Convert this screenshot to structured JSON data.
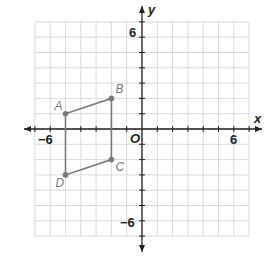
{
  "chart_data": {
    "type": "scatter",
    "title": "",
    "xlabel": "x",
    "ylabel": "y",
    "xlim": [
      -7,
      7
    ],
    "ylim": [
      -7,
      7
    ],
    "grid": true,
    "origin_label": "O",
    "tick_labels": {
      "x": [
        {
          "value": -6,
          "label": "−6"
        },
        {
          "value": 6,
          "label": "6"
        }
      ],
      "y": [
        {
          "value": 6,
          "label": "6"
        },
        {
          "value": -6,
          "label": "−6"
        }
      ]
    },
    "points": [
      {
        "name": "A",
        "x": -5,
        "y": 1
      },
      {
        "name": "B",
        "x": -2,
        "y": 2
      },
      {
        "name": "C",
        "x": -2,
        "y": -2
      },
      {
        "name": "D",
        "x": -5,
        "y": -3
      }
    ],
    "polygon": [
      "A",
      "B",
      "C",
      "D"
    ],
    "colors": {
      "shape": "#7a7a7a",
      "axis": "#231f20",
      "grid": "#d9d9d9"
    }
  }
}
